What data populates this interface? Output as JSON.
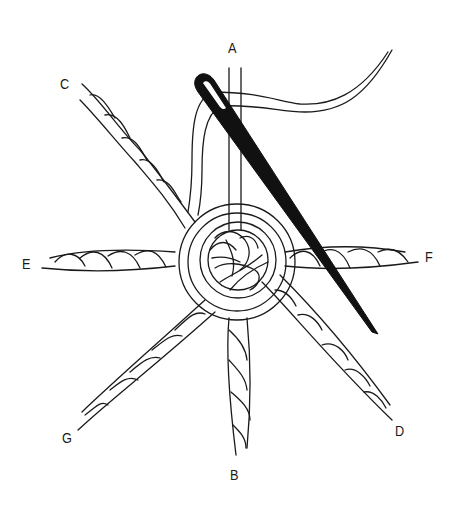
{
  "illustration": {
    "description": "Line drawing of a needle and thread weaving around the center of twisted-cord spokes",
    "spoke_labels": [
      {
        "id": "A",
        "text": "A",
        "x": 228,
        "y": 40
      },
      {
        "id": "C",
        "text": "C",
        "x": 60,
        "y": 76
      },
      {
        "id": "E",
        "text": "E",
        "x": 22,
        "y": 256
      },
      {
        "id": "F",
        "text": "F",
        "x": 425,
        "y": 249
      },
      {
        "id": "G",
        "text": "G",
        "x": 62,
        "y": 430
      },
      {
        "id": "B",
        "text": "B",
        "x": 230,
        "y": 467
      },
      {
        "id": "D",
        "text": "D",
        "x": 395,
        "y": 423
      }
    ],
    "colors": {
      "line": "#1a1a1a",
      "needle": "#111111",
      "background": "#ffffff"
    }
  }
}
